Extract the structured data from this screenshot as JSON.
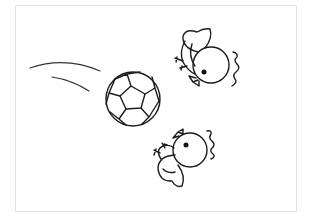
{
  "illustration": {
    "subject": "Soccer ball with two chicks",
    "style": "black line drawing on white",
    "colors": {
      "line": "#1c1c1c",
      "background": "#ffffff",
      "frame": "#e2e2e2"
    },
    "elements": [
      {
        "name": "motion-lines",
        "count": 2
      },
      {
        "name": "soccer-ball"
      },
      {
        "name": "chick-top",
        "sound_marks": true
      },
      {
        "name": "chick-bottom",
        "sound_marks": true
      }
    ]
  }
}
